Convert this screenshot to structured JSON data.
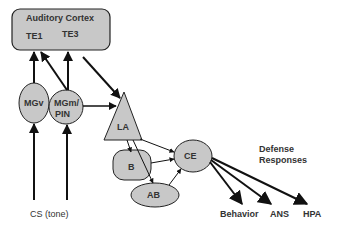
{
  "diagram": {
    "colors": {
      "node_fill": "#c8c8c8",
      "stroke": "#111111",
      "text": "#333333",
      "background": "#ffffff"
    },
    "cortex": {
      "title": "Auditory Cortex",
      "te1": "TE1",
      "te3": "TE3"
    },
    "nodes": {
      "mgv": "MGv",
      "mgm_line1": "MGm/",
      "mgm_line2": "PIN",
      "la": "LA",
      "b": "B",
      "ab": "AB",
      "ce": "CE"
    },
    "input": "CS (tone)",
    "defense": {
      "line1": "Defense",
      "line2": "Responses"
    },
    "outputs": [
      "Behavior",
      "ANS",
      "HPA"
    ]
  }
}
